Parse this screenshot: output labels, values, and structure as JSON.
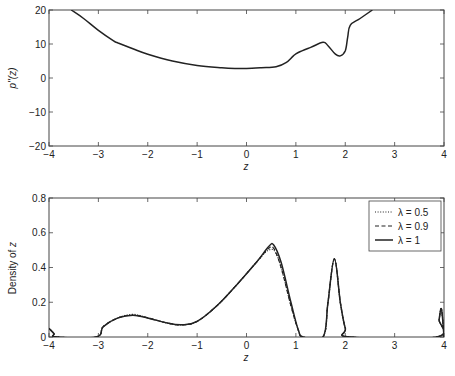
{
  "chart_data": [
    {
      "type": "line",
      "title": "",
      "xlabel": "z",
      "ylabel": "p''(z)",
      "xlim": [
        -4,
        4
      ],
      "ylim": [
        -20,
        20
      ],
      "xticks": [
        "-4",
        "-3",
        "-2",
        "-1",
        "0",
        "1",
        "2",
        "3",
        "4"
      ],
      "yticks": [
        "20",
        "10",
        "0",
        "-10",
        "-20"
      ],
      "grid": false,
      "series": [
        {
          "name": "p''(z)",
          "style": "solid",
          "x": [
            -3.55,
            -3.3,
            -3.0,
            -2.7,
            -2.6,
            -2.3,
            -2.0,
            -1.5,
            -1.0,
            -0.5,
            -0.2,
            0.0,
            0.3,
            0.6,
            0.8,
            0.95,
            1.05,
            1.3,
            1.55,
            1.65,
            1.8,
            1.9,
            2.0,
            2.05,
            2.1,
            2.3,
            2.55
          ],
          "y": [
            20.0,
            17.5,
            14.0,
            11.0,
            10.3,
            8.6,
            7.0,
            5.0,
            3.7,
            3.0,
            2.8,
            2.8,
            3.0,
            3.3,
            4.5,
            6.5,
            7.5,
            9.0,
            10.5,
            9.5,
            7.0,
            6.5,
            8.0,
            12.0,
            15.5,
            17.5,
            20.0
          ]
        }
      ]
    },
    {
      "type": "line",
      "title": "",
      "xlabel": "z",
      "ylabel": "Density of z",
      "xlim": [
        -4,
        4
      ],
      "ylim": [
        0,
        0.8
      ],
      "xticks": [
        "-4",
        "-3",
        "-2",
        "-1",
        "0",
        "1",
        "2",
        "3",
        "4"
      ],
      "yticks": [
        "0.8",
        "0.6",
        "0.4",
        "0.2",
        "0"
      ],
      "grid": false,
      "legend_position": "upper right",
      "series": [
        {
          "name": "λ = 0.5",
          "style": "dotted",
          "x": [
            -4.0,
            -3.9,
            -3.85,
            -3.05,
            -2.9,
            -2.6,
            -2.3,
            -2.0,
            -1.6,
            -1.3,
            -1.0,
            -0.6,
            -0.2,
            0.2,
            0.45,
            0.6,
            0.75,
            0.9,
            1.05,
            1.15,
            1.55,
            1.65,
            1.78,
            1.9,
            2.0,
            2.1,
            3.85,
            3.9,
            3.95,
            4.0
          ],
          "y": [
            0.05,
            0.02,
            0.0,
            0.0,
            0.06,
            0.11,
            0.13,
            0.11,
            0.08,
            0.07,
            0.09,
            0.18,
            0.3,
            0.43,
            0.5,
            0.48,
            0.35,
            0.18,
            0.04,
            0.0,
            0.0,
            0.2,
            0.45,
            0.2,
            0.05,
            0.0,
            0.0,
            0.1,
            0.16,
            0.0
          ]
        },
        {
          "name": "λ = 0.9",
          "style": "dashed",
          "x": [
            -4.0,
            -3.9,
            -3.85,
            -3.05,
            -2.9,
            -2.6,
            -2.3,
            -2.0,
            -1.6,
            -1.3,
            -1.0,
            -0.6,
            -0.2,
            0.2,
            0.45,
            0.55,
            0.7,
            0.9,
            1.05,
            1.15,
            1.55,
            1.65,
            1.78,
            1.9,
            2.0,
            2.1,
            3.85,
            3.9,
            3.95,
            4.0
          ],
          "y": [
            0.05,
            0.02,
            0.0,
            0.0,
            0.06,
            0.11,
            0.125,
            0.11,
            0.08,
            0.07,
            0.09,
            0.18,
            0.3,
            0.43,
            0.51,
            0.51,
            0.4,
            0.18,
            0.04,
            0.0,
            0.0,
            0.2,
            0.45,
            0.2,
            0.05,
            0.0,
            0.0,
            0.1,
            0.16,
            0.0
          ]
        },
        {
          "name": "λ = 1",
          "style": "solid",
          "x": [
            -4.0,
            -3.9,
            -3.85,
            -3.05,
            -2.9,
            -2.6,
            -2.3,
            -2.0,
            -1.6,
            -1.3,
            -1.0,
            -0.6,
            -0.2,
            0.2,
            0.45,
            0.55,
            0.7,
            0.9,
            1.05,
            1.15,
            1.55,
            1.65,
            1.78,
            1.9,
            2.0,
            2.1,
            3.85,
            3.9,
            3.95,
            4.0
          ],
          "y": [
            0.05,
            0.02,
            0.0,
            0.0,
            0.06,
            0.11,
            0.125,
            0.11,
            0.08,
            0.07,
            0.09,
            0.18,
            0.3,
            0.43,
            0.52,
            0.53,
            0.43,
            0.2,
            0.04,
            0.0,
            0.0,
            0.2,
            0.45,
            0.2,
            0.05,
            0.0,
            0.0,
            0.1,
            0.16,
            0.0
          ]
        }
      ]
    }
  ],
  "top_plot": {
    "ylabel": "p''(z)",
    "xlabel": "z",
    "xticks": [
      "−4",
      "−3",
      "−2",
      "−1",
      "0",
      "1",
      "2",
      "3",
      "4"
    ],
    "yticks": [
      "20",
      "10",
      "0",
      "−10",
      "−20"
    ]
  },
  "bottom_plot": {
    "ylabel": "Density of z",
    "xlabel": "z",
    "xticks": [
      "−4",
      "−3",
      "−2",
      "−1",
      "0",
      "1",
      "2",
      "3",
      "4"
    ],
    "yticks": [
      "0.8",
      "0.6",
      "0.4",
      "0.2",
      "0"
    ],
    "legend": [
      {
        "label": "λ = 0.5",
        "style": "dotted"
      },
      {
        "label": "λ = 0.9",
        "style": "dashed"
      },
      {
        "label": "λ = 1",
        "style": "solid"
      }
    ]
  },
  "colors": {
    "line": "#222222",
    "axis": "#444444",
    "background": "#ffffff"
  }
}
